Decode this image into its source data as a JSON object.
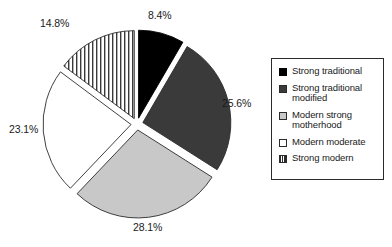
{
  "chart_data": {
    "type": "pie",
    "title": "",
    "subtitle": "",
    "xlabel": "",
    "ylabel": "",
    "legend_position": "right",
    "grid": false,
    "exploded": true,
    "units": "percent",
    "categories": [
      "Strong traditional",
      "Strong traditional modified",
      "Modern strong motherhood",
      "Modern moderate",
      "Strong modern"
    ],
    "values": [
      8.4,
      25.6,
      28.1,
      23.1,
      14.8
    ],
    "labels": [
      "8.4%",
      "25.6%",
      "28.1%",
      "23.1%",
      "14.8%"
    ],
    "slice_fills": [
      "solid-black",
      "solid-dark-gray",
      "solid-light-gray",
      "solid-white",
      "vertical-stripes"
    ],
    "colors": [
      "#000000",
      "#3a3a3a",
      "#c8c8c8",
      "#ffffff",
      "#ffffff"
    ],
    "outline_color": "#2b2b2b",
    "start_angle_deg": 0,
    "direction": "clockwise",
    "total": 100.0
  },
  "legend": {
    "items": [
      {
        "label": "Strong traditional",
        "swatch": "solid-black-swatch"
      },
      {
        "label": "Strong traditional modified",
        "swatch": "solid-dark-gray-swatch"
      },
      {
        "label": "Modern strong motherhood",
        "swatch": "solid-light-gray-swatch"
      },
      {
        "label": "Modern moderate",
        "swatch": "solid-white-swatch"
      },
      {
        "label": "Strong modern",
        "swatch": "vertical-stripes-swatch"
      }
    ]
  }
}
